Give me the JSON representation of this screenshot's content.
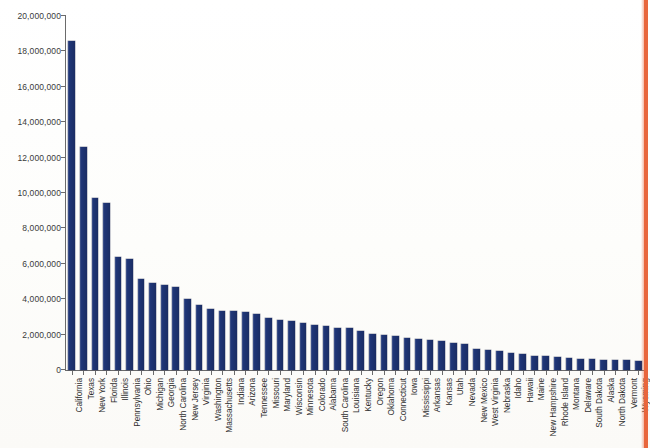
{
  "page": {
    "background_color": "#fdfdfc",
    "border_accent_color": "#e8663c"
  },
  "chart_data": {
    "type": "bar",
    "title": "",
    "xlabel": "",
    "ylabel": "",
    "ylim": [
      0,
      20000000
    ],
    "ytick_values": [
      0,
      2000000,
      4000000,
      6000000,
      8000000,
      10000000,
      12000000,
      14000000,
      16000000,
      18000000,
      20000000
    ],
    "ytick_labels": [
      "0",
      "2,000,000",
      "4,000,000",
      "6,000,000",
      "8,000,000",
      "10,000,000",
      "12,000,000",
      "14,000,000",
      "16,000,000",
      "18,000,000",
      "20,000,000"
    ],
    "grid": false,
    "legend": null,
    "bar_color": "#1f3576",
    "orientation": "vertical",
    "sorted": "descending",
    "categories": [
      "California",
      "Texas",
      "New York",
      "Florida",
      "Illinois",
      "Pennsylvania",
      "Ohio",
      "Michigan",
      "Georgia",
      "North Carolina",
      "New Jersey",
      "Virginia",
      "Washington",
      "Massachusetts",
      "Indiana",
      "Arizona",
      "Tennessee",
      "Missouri",
      "Maryland",
      "Wisconsin",
      "Minnesota",
      "Colorado",
      "Alabama",
      "South Carolina",
      "Louisiana",
      "Kentucky",
      "Oregon",
      "Oklahoma",
      "Connecticut",
      "Iowa",
      "Mississippi",
      "Arkansas",
      "Kansas",
      "Utah",
      "Nevada",
      "New Mexico",
      "West Virginia",
      "Nebraska",
      "Idaho",
      "Hawaii",
      "Maine",
      "New Hampshire",
      "Rhode Island",
      "Montana",
      "Delaware",
      "South Dakota",
      "Alaska",
      "North Dakota",
      "Vermont",
      "Wyoming"
    ],
    "values": [
      18600000,
      12600000,
      9700000,
      9450000,
      6400000,
      6300000,
      5150000,
      4900000,
      4800000,
      4700000,
      4000000,
      3700000,
      3450000,
      3350000,
      3350000,
      3300000,
      3150000,
      2950000,
      2800000,
      2750000,
      2650000,
      2550000,
      2500000,
      2400000,
      2350000,
      2200000,
      2050000,
      2000000,
      1950000,
      1800000,
      1750000,
      1700000,
      1650000,
      1500000,
      1450000,
      1200000,
      1150000,
      1100000,
      950000,
      900000,
      800000,
      780000,
      740000,
      700000,
      620000,
      600000,
      580000,
      560000,
      540000,
      530000
    ]
  }
}
